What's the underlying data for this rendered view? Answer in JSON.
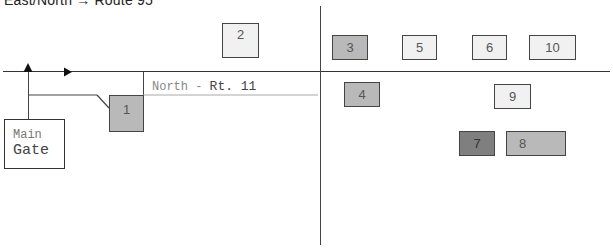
{
  "header": {
    "title": "East/North → Route 95"
  },
  "route_label": {
    "direction": "North - ",
    "route": "Rt. 11"
  },
  "main_gate": {
    "line1": "Main",
    "line2": "Gate"
  },
  "colors": {
    "light_lot": "#f1f1f1",
    "medium_lot": "#b9b9b9",
    "dark_lot": "#7f7f7f",
    "line": "#333333"
  },
  "lots": [
    {
      "id": "1",
      "label": "1",
      "shade": "mid"
    },
    {
      "id": "2",
      "label": "2",
      "shade": "light"
    },
    {
      "id": "3",
      "label": "3",
      "shade": "mid"
    },
    {
      "id": "4",
      "label": "4",
      "shade": "mid"
    },
    {
      "id": "5",
      "label": "5",
      "shade": "light"
    },
    {
      "id": "6",
      "label": "6",
      "shade": "light"
    },
    {
      "id": "7",
      "label": "7",
      "shade": "dark"
    },
    {
      "id": "8",
      "label": "8",
      "shade": "mid"
    },
    {
      "id": "9",
      "label": "9",
      "shade": "light"
    },
    {
      "id": "10",
      "label": "10",
      "shade": "light"
    }
  ]
}
